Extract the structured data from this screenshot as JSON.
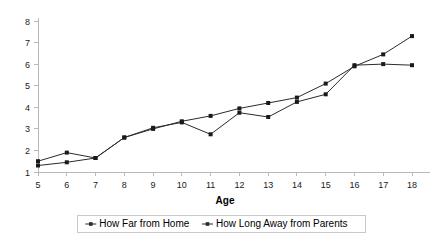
{
  "chart_data": {
    "type": "line",
    "title": "",
    "xlabel": "Age",
    "ylabel": "",
    "xlim": [
      5,
      18
    ],
    "ylim": [
      1,
      8
    ],
    "grid": false,
    "legend_position": "bottom",
    "x": [
      5,
      6,
      7,
      8,
      9,
      10,
      11,
      12,
      13,
      14,
      15,
      16,
      17,
      18
    ],
    "xticklabels": [
      "5",
      "6",
      "7",
      "8",
      "9",
      "10",
      "11",
      "12",
      "13",
      "14",
      "15",
      "16",
      "17",
      "18"
    ],
    "yticklabels": [
      "1",
      "2",
      "3",
      "4",
      "5",
      "6",
      "7",
      "8"
    ],
    "yticks": [
      1,
      2,
      3,
      4,
      5,
      6,
      7,
      8
    ],
    "series": [
      {
        "name": "How Far from Home",
        "marker": "square",
        "color": "#2b2b2b",
        "values": [
          1.5,
          1.9,
          1.65,
          2.6,
          3.05,
          3.3,
          2.75,
          3.75,
          3.55,
          4.25,
          4.6,
          5.95,
          6.0,
          5.95
        ]
      },
      {
        "name": "How Long Away from Parents",
        "marker": "square",
        "color": "#2b2b2b",
        "values": [
          1.3,
          1.45,
          1.65,
          2.6,
          3.0,
          3.35,
          3.6,
          3.95,
          4.2,
          4.45,
          5.1,
          5.9,
          6.45,
          7.3
        ]
      }
    ]
  },
  "legend": {
    "items": [
      {
        "label": "How Far from Home"
      },
      {
        "label": "How Long Away from Parents"
      }
    ]
  },
  "axes": {
    "x_title": "Age"
  }
}
